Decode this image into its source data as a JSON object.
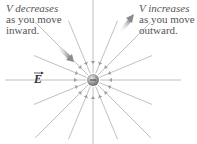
{
  "labels": {
    "decrease": {
      "line1": "V decreases",
      "line2": "as you move",
      "line3": "inward."
    },
    "increase": {
      "line1": "V increases",
      "line2": "as you move",
      "line3": "outward."
    },
    "field": "E"
  },
  "charge": {
    "sign": "-",
    "cx": 93,
    "cy": 80,
    "r": 6,
    "color": "#9a9a9a"
  },
  "field_lines": {
    "count": 16,
    "color": "#b0b0b0",
    "lengths": [
      88,
      64,
      82,
      64,
      88,
      64,
      82,
      64,
      88,
      64,
      82,
      64,
      88,
      64,
      82,
      64
    ]
  },
  "gradient_arrows": {
    "inward": {
      "x1": 56,
      "y1": 44,
      "x2": 72,
      "y2": 60
    },
    "outward": {
      "x1": 120,
      "y1": 30,
      "x2": 133,
      "y2": 16
    }
  }
}
